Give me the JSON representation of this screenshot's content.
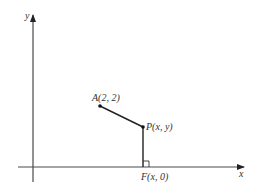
{
  "diagram": {
    "type": "coordinate-geometry",
    "axes": {
      "x_label": "x",
      "y_label": "y"
    },
    "points": {
      "A": {
        "label": "A(2, 2)"
      },
      "P": {
        "label": "P(x, y)"
      },
      "F": {
        "label": "F(x, 0)"
      }
    },
    "segments": [
      {
        "from": "A",
        "to": "P"
      },
      {
        "from": "P",
        "to": "F"
      }
    ],
    "annotations": {
      "right_angle_at": "F"
    },
    "colors": {
      "line": "#222222",
      "axis": "#4a4a4a",
      "text": "#333333",
      "background": "#ffffff"
    }
  }
}
